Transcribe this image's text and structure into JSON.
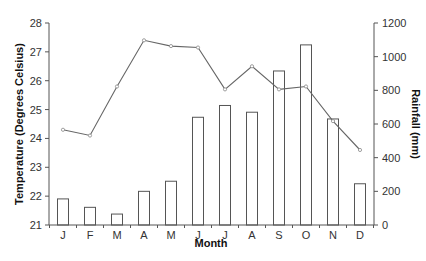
{
  "chart_data": {
    "type": "bar+line",
    "title": "",
    "xlabel": "Month",
    "categories": [
      "J",
      "F",
      "M",
      "A",
      "M",
      "J",
      "J",
      "A",
      "S",
      "O",
      "N",
      "D"
    ],
    "series": [
      {
        "name": "Rainfall (mm)",
        "type": "bar",
        "axis": "right",
        "values": [
          155,
          105,
          65,
          200,
          260,
          640,
          710,
          670,
          915,
          1070,
          630,
          245
        ]
      },
      {
        "name": "Temperature (Degrees Celsius)",
        "type": "line",
        "axis": "left",
        "markers": true,
        "values": [
          24.3,
          24.1,
          25.8,
          27.4,
          27.2,
          27.15,
          25.7,
          26.5,
          25.7,
          25.8,
          24.6,
          23.6
        ]
      }
    ],
    "y_left": {
      "label": "Temperature (Degrees Celsius)",
      "min": 21,
      "max": 28,
      "ticks": [
        21,
        22,
        23,
        24,
        25,
        26,
        27,
        28
      ]
    },
    "y_right": {
      "label": "Rainfall (mm)",
      "min": 0,
      "max": 1200,
      "ticks": [
        0,
        200,
        400,
        600,
        800,
        1000,
        1200
      ]
    },
    "grid": false,
    "legend": null,
    "colors": {
      "axis": "#555555",
      "bar_fill": "#ffffff",
      "bar_stroke": "#555555",
      "line": "#666666"
    }
  }
}
